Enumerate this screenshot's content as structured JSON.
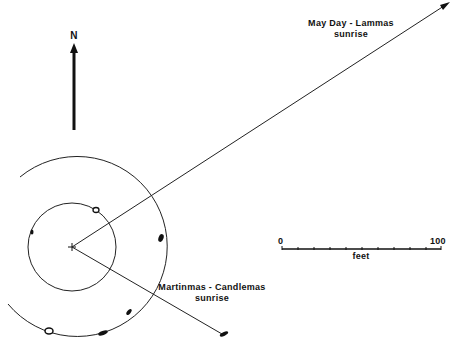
{
  "north": {
    "label": "N"
  },
  "alignments": [
    {
      "name": "May Day - Lammas",
      "line1": "May Day - Lammas",
      "line2": "sunrise"
    },
    {
      "name": "Martinmas - Candlemas",
      "line1": "Martinmas - Candlemas",
      "line2": "sunrise"
    }
  ],
  "scale": {
    "min_label": "0",
    "max_label": "100",
    "unit_label": "feet",
    "ticks": 10
  },
  "colors": {
    "ink": "#111111",
    "background": "#ffffff"
  }
}
